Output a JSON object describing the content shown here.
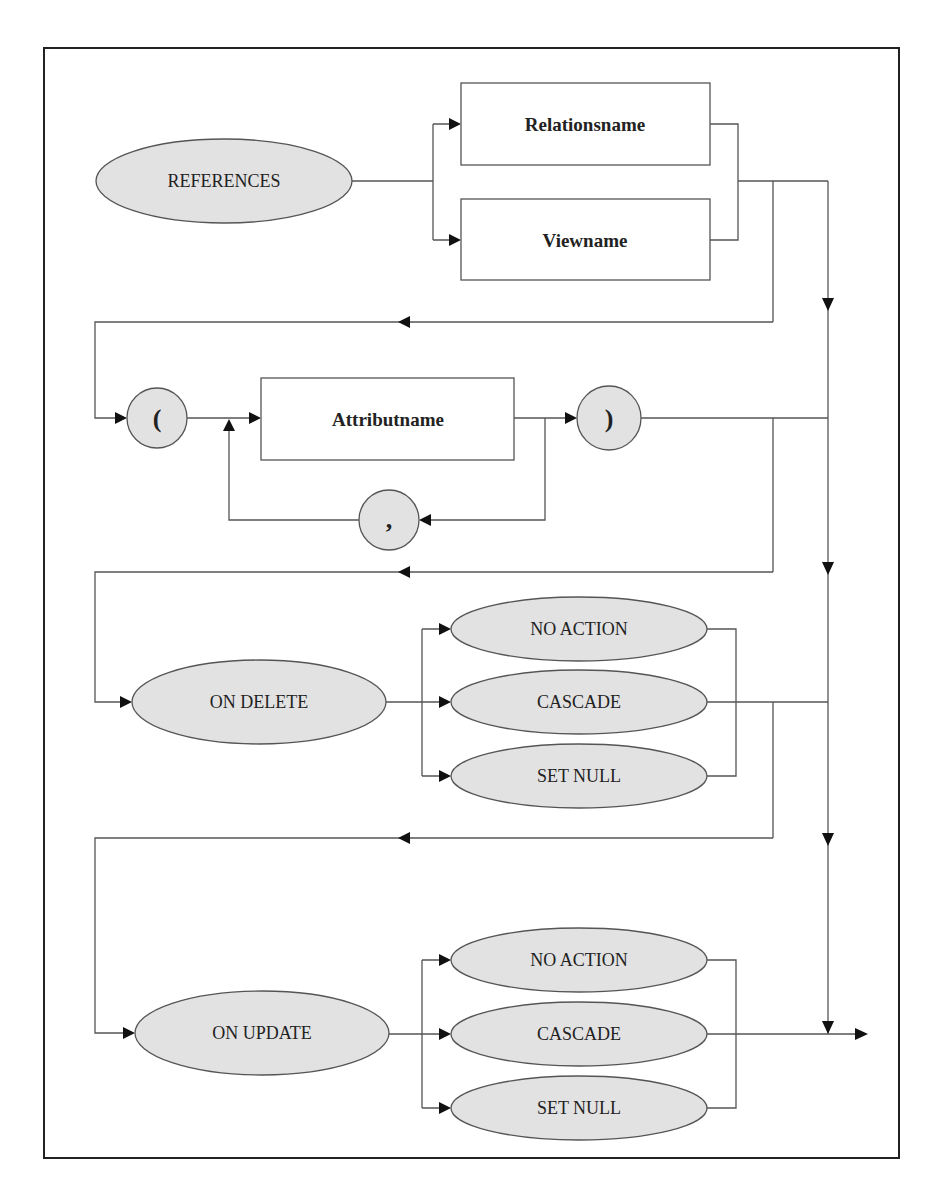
{
  "diagram": {
    "start_keyword": "REFERENCES",
    "target_choices": [
      "Relationsname",
      "Viewname"
    ],
    "attribute_list": {
      "open": "(",
      "item": "Attributname",
      "separator": ",",
      "close": ")"
    },
    "on_delete": {
      "keyword": "ON DELETE",
      "options": [
        "NO ACTION",
        "CASCADE",
        "SET NULL"
      ]
    },
    "on_update": {
      "keyword": "ON UPDATE",
      "options": [
        "NO ACTION",
        "CASCADE",
        "SET NULL"
      ]
    },
    "colors": {
      "terminal_fill": "#e2e2e2",
      "nonterminal_fill": "#ffffff",
      "stroke": "#555555",
      "frame": "#222222"
    }
  }
}
